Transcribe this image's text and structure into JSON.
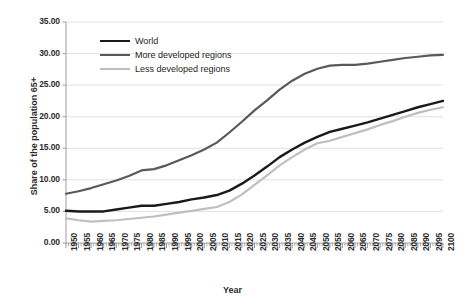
{
  "chart_data": {
    "type": "line",
    "title": "",
    "xlabel": "Year",
    "ylabel": "Share of the population 65+",
    "xlim": [
      1950,
      2100
    ],
    "ylim": [
      0,
      35
    ],
    "ytick_step": 5,
    "grid": true,
    "legend_position": "top-left-inside",
    "ytick_labels": [
      "0.00",
      "5.00",
      "10.00",
      "15.00",
      "20.00",
      "25.00",
      "30.00",
      "35.00"
    ],
    "ytick_values": [
      0,
      5,
      10,
      15,
      20,
      25,
      30,
      35
    ],
    "categories": [
      1950,
      1955,
      1960,
      1965,
      1970,
      1975,
      1980,
      1985,
      1990,
      1995,
      2000,
      2005,
      2010,
      2015,
      2020,
      2025,
      2030,
      2035,
      2040,
      2045,
      2050,
      2055,
      2060,
      2065,
      2070,
      2075,
      2080,
      2085,
      2090,
      2095,
      2100
    ],
    "xtick_labels": [
      "1950",
      "1955",
      "1960",
      "1965",
      "1970",
      "1975",
      "1980",
      "1985",
      "1990",
      "1995",
      "2000",
      "2005",
      "2010",
      "2015",
      "2020",
      "2025",
      "2030",
      "2035",
      "2040",
      "2045",
      "2050",
      "2055",
      "2060",
      "2065",
      "2070",
      "2075",
      "2080",
      "2085",
      "2090",
      "2095",
      "2100"
    ],
    "series": [
      {
        "name": "World",
        "color": "#1a1a1a",
        "width": 2.4,
        "values": [
          5.1,
          5.0,
          5.0,
          5.0,
          5.3,
          5.6,
          5.9,
          5.9,
          6.2,
          6.5,
          6.9,
          7.2,
          7.6,
          8.3,
          9.4,
          10.7,
          12.1,
          13.6,
          14.8,
          15.9,
          16.8,
          17.6,
          18.1,
          18.6,
          19.1,
          19.7,
          20.3,
          20.9,
          21.5,
          22.0,
          22.5
        ]
      },
      {
        "name": "More developed regions",
        "color": "#595959",
        "width": 2.2,
        "values": [
          7.8,
          8.2,
          8.7,
          9.3,
          9.9,
          10.6,
          11.5,
          11.7,
          12.3,
          13.1,
          13.9,
          14.8,
          15.9,
          17.5,
          19.2,
          21.0,
          22.6,
          24.3,
          25.7,
          26.8,
          27.6,
          28.1,
          28.2,
          28.2,
          28.4,
          28.7,
          29.0,
          29.3,
          29.5,
          29.7,
          29.8
        ]
      },
      {
        "name": "Less developed regions",
        "color": "#bfbfbf",
        "width": 2.2,
        "values": [
          3.9,
          3.6,
          3.4,
          3.5,
          3.6,
          3.8,
          4.0,
          4.2,
          4.5,
          4.8,
          5.1,
          5.4,
          5.7,
          6.5,
          7.7,
          9.2,
          10.7,
          12.3,
          13.6,
          14.8,
          15.8,
          16.2,
          16.8,
          17.4,
          18.0,
          18.7,
          19.3,
          20.0,
          20.6,
          21.1,
          21.5
        ]
      }
    ]
  },
  "axis": {
    "y_title": "Share of the population 65+",
    "x_title": "Year"
  }
}
